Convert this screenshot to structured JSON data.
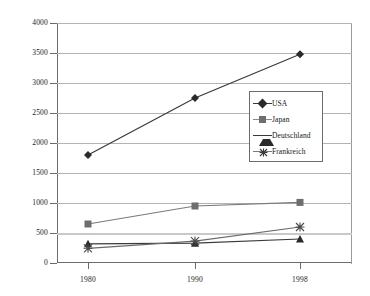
{
  "chart_data": {
    "type": "line",
    "title": "",
    "subtitle": "",
    "xlabel": "",
    "ylabel": "",
    "categories": [
      "1980",
      "1990",
      "1998"
    ],
    "x": [
      1980,
      1990,
      1998
    ],
    "ylim": [
      0,
      4000
    ],
    "yticks": [
      0,
      500,
      1000,
      1500,
      2000,
      2500,
      3000,
      3500,
      4000
    ],
    "ytick_labels": [
      "0",
      "500",
      "1000",
      "1500",
      "2000",
      "2500",
      "3000",
      "3500",
      "4000"
    ],
    "grid": true,
    "legend_position": "center-right",
    "series": [
      {
        "name": "USA",
        "values": [
          1800,
          2750,
          3480
        ],
        "marker": "diamond",
        "color": "#2a2a2a",
        "line_color": "#3a3a3a"
      },
      {
        "name": "Japan",
        "values": [
          650,
          950,
          1010
        ],
        "marker": "square",
        "color": "#6e6e6e",
        "line_color": "#7a7a7a"
      },
      {
        "name": "Deutschland",
        "values": [
          320,
          330,
          400
        ],
        "marker": "triangle",
        "color": "#2a2a2a",
        "line_color": "#3a3a3a"
      },
      {
        "name": "Frankreich",
        "values": [
          245,
          365,
          600
        ],
        "marker": "cross",
        "color": "#4a4a4a",
        "line_color": "#6a6a6a"
      }
    ]
  },
  "axes": {
    "y_labels": [
      "4000",
      "3500",
      "3000",
      "2500",
      "2000",
      "1500",
      "1000",
      "500",
      "0"
    ],
    "x_labels": [
      "1980",
      "1990",
      "1998"
    ]
  },
  "legend": {
    "entries": [
      {
        "label": "USA",
        "marker": "diamond-marker"
      },
      {
        "label": "Japan",
        "marker": "square-marker"
      },
      {
        "label": "Deutschland",
        "marker": "triangle-marker"
      },
      {
        "label": "Frankreich",
        "marker": "cross-marker"
      }
    ]
  },
  "colors": {
    "grid": "#b3b3b3",
    "axis": "#6b6b6b",
    "text": "#1a1a1a",
    "background": "#ffffff"
  }
}
